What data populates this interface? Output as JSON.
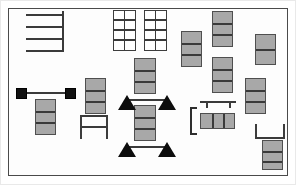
{
  "document": {
    "title": "Floor plan layout diagram",
    "kind": "line-drawing",
    "background_color": "#ffffff"
  },
  "palette": {
    "module_fill": "#a8a8a8",
    "module_stroke": "#4f4f4f",
    "line": "#3a3a3a",
    "solid_marker": "#0d0d0d",
    "frame": "#4a4a4a",
    "open_fill": "#ffffff"
  },
  "frame": {
    "name": "plan-boundary",
    "x": 8,
    "y": 8,
    "width": 280,
    "height": 168
  },
  "legend": {
    "module": "shelf-module",
    "grid": "open-rack",
    "triangle": "corner-marker",
    "node": "post-node",
    "bench": "work-bench",
    "bracket": "dimension-bracket"
  },
  "elements": {
    "comb": {
      "name": "comb-rack",
      "x": 22,
      "y": 11,
      "width": 42,
      "height": 41,
      "teeth": 4
    },
    "open_racks": [
      {
        "name": "open-rack-left",
        "x": 113,
        "y": 10,
        "width": 23,
        "height": 41,
        "cols": 2,
        "rows": 4
      },
      {
        "name": "open-rack-right",
        "x": 144,
        "y": 10,
        "width": 23,
        "height": 41,
        "cols": 2,
        "rows": 4
      }
    ],
    "modules": [
      {
        "name": "module-stack-upper-mid",
        "x": 134,
        "y": 58,
        "width": 22,
        "height": 36,
        "segments": 3
      },
      {
        "name": "module-stack-upper-right1",
        "x": 181,
        "y": 31,
        "width": 21,
        "height": 36,
        "segments": 3
      },
      {
        "name": "module-stack-upper-right2",
        "x": 212,
        "y": 11,
        "width": 21,
        "height": 36,
        "segments": 3
      },
      {
        "name": "module-stack-upper-right3",
        "x": 212,
        "y": 57,
        "width": 21,
        "height": 36,
        "segments": 3
      },
      {
        "name": "module-stack-far-right1",
        "x": 255,
        "y": 34,
        "width": 21,
        "height": 31,
        "segments": 2
      },
      {
        "name": "module-stack-far-right2",
        "x": 245,
        "y": 78,
        "width": 21,
        "height": 36,
        "segments": 3
      },
      {
        "name": "module-stack-left-mid",
        "x": 85,
        "y": 78,
        "width": 21,
        "height": 36,
        "segments": 3
      },
      {
        "name": "module-stack-node-left",
        "x": 35,
        "y": 99,
        "width": 21,
        "height": 36,
        "segments": 3
      },
      {
        "name": "module-stack-center",
        "x": 134,
        "y": 105,
        "width": 22,
        "height": 36,
        "segments": 3
      },
      {
        "name": "module-row-bottom-mid",
        "x": 200,
        "y": 113,
        "width": 35,
        "height": 16,
        "segments": 3,
        "orientation": "horizontal"
      },
      {
        "name": "module-stack-bottom-right",
        "x": 262,
        "y": 140,
        "width": 21,
        "height": 30,
        "segments": 2
      }
    ],
    "nodes": [
      {
        "name": "post-node-left",
        "x": 16,
        "y": 88,
        "size": 11
      },
      {
        "name": "post-node-right",
        "x": 65,
        "y": 88,
        "size": 11
      }
    ],
    "node_rail": {
      "name": "node-connector-rail",
      "x": 27,
      "y": 92,
      "width": 38,
      "height": 2
    },
    "triangles": [
      {
        "name": "corner-marker-top-left",
        "x": 118,
        "y": 95
      },
      {
        "name": "corner-marker-top-right",
        "x": 158,
        "y": 95
      },
      {
        "name": "corner-marker-bottom-left",
        "x": 118,
        "y": 141
      },
      {
        "name": "corner-marker-bottom-right",
        "x": 158,
        "y": 141
      }
    ],
    "triangle_rails": [
      {
        "name": "marker-rail-top",
        "x": 127,
        "y": 99,
        "width": 40,
        "height": 2
      },
      {
        "name": "marker-rail-bottom",
        "x": 127,
        "y": 145,
        "width": 40,
        "height": 2
      }
    ],
    "benches": [
      {
        "name": "work-bench-left",
        "x": 80,
        "y": 115,
        "width": 28,
        "height": 20
      },
      {
        "name": "work-bench-right",
        "x": 255,
        "y": 124,
        "width": 28,
        "height": 14
      }
    ],
    "hanger": {
      "name": "ceiling-hanger-rail",
      "x": 201,
      "y": 101,
      "width": 34,
      "height": 8
    },
    "bracket": {
      "name": "dimension-bracket",
      "x": 190,
      "y": 107,
      "width": 6,
      "height": 28
    }
  }
}
